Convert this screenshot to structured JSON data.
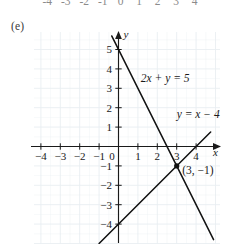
{
  "figure": {
    "part_label": "(e)",
    "previous_figure_tick_labels": [
      "-4",
      "-3",
      "-2",
      "-1",
      "0",
      "1",
      "2",
      "3",
      "4"
    ]
  },
  "chart_data": {
    "type": "line",
    "title": "",
    "xlabel": "x",
    "ylabel": "y",
    "xlim": [
      -5.0,
      5.3
    ],
    "ylim": [
      -5.3,
      6.0
    ],
    "xticks": [
      -4,
      -3,
      -2,
      -1,
      1,
      2,
      3,
      4
    ],
    "yticks": [
      5,
      4,
      3,
      2,
      1,
      -1,
      -2,
      -3,
      -4
    ],
    "xtick_labels": [
      "-4",
      "-3",
      "-2",
      "-1",
      "1",
      "2",
      "3",
      "4"
    ],
    "ytick_labels": [
      "5",
      "4",
      "3",
      "2",
      "1",
      "-1",
      "-2",
      "-3",
      "-4"
    ],
    "origin_label": "0",
    "grid": true,
    "grid_color": "#e9eef2",
    "axis_color": "#1a1a1a",
    "series": [
      {
        "name": "2x + y = 5",
        "label": "2x + y = 5",
        "equation": "2x + y = 5",
        "slope": -2,
        "intercept": 5,
        "color": "#111111",
        "label_x": 1.15,
        "label_y": 3.35,
        "points": [
          [
            -0.35,
            5.7
          ],
          [
            4.9,
            -4.8
          ]
        ]
      },
      {
        "name": "y = x - 4",
        "label": "y = x − 4",
        "equation": "y = x - 4",
        "slope": 1,
        "intercept": -4,
        "color": "#111111",
        "label_x": 3.0,
        "label_y": 1.45,
        "points": [
          [
            -1.0,
            -5.0
          ],
          [
            4.75,
            0.75
          ]
        ]
      }
    ],
    "annotations": [
      {
        "name": "intersection-point",
        "label": "(3, −1)",
        "x": 3,
        "y": -1,
        "marker": "filled-circle"
      }
    ]
  }
}
